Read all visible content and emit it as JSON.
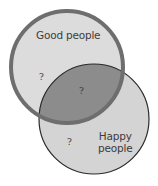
{
  "diagram": {
    "type": "venn",
    "colors": {
      "good_fill": "#dcdcdc",
      "good_stroke": "#6e6e6e",
      "happy_fill": "#d4d4d4",
      "happy_stroke": "#2a2a2a",
      "intersection_fill": "#8c8c8c"
    },
    "sets": [
      {
        "id": "good",
        "label": "Good people"
      },
      {
        "id": "happy",
        "label_line1": "Happy",
        "label_line2": "people"
      }
    ],
    "regions": {
      "good_only": "?",
      "intersection": "?",
      "happy_only": "?"
    }
  }
}
